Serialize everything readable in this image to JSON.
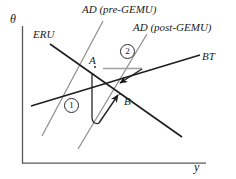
{
  "figure": {
    "axes": {
      "y_axis_label": "θ",
      "x_axis_label": "y",
      "origin": [
        22,
        163
      ],
      "x_axis_end": [
        205,
        163
      ],
      "y_axis_top": [
        22,
        26
      ],
      "axis_color": "#555555"
    },
    "curves": [
      {
        "name": "AD (pre-GEMU)",
        "label": "AD (pre-GEMU)",
        "slope": "upward",
        "color": "#8a8a8a",
        "from": [
          42,
          136
        ],
        "to": [
          103,
          21
        ]
      },
      {
        "name": "AD (post-GEMU)",
        "label": "AD (post-GEMU)",
        "slope": "upward",
        "color": "#8a8a8a",
        "from": [
          78,
          149
        ],
        "to": [
          147,
          34
        ]
      },
      {
        "name": "ERU",
        "label": "ERU",
        "slope": "downward",
        "color": "#222222",
        "from": [
          50,
          44
        ],
        "to": [
          182,
          137
        ]
      },
      {
        "name": "BT",
        "label": "BT",
        "slope": "upward",
        "color": "#222222",
        "from": [
          31,
          106
        ],
        "to": [
          200,
          55
        ]
      }
    ],
    "points": [
      {
        "name": "A",
        "label": "A",
        "at": [
          95,
          67
        ]
      },
      {
        "name": "B",
        "label": "B",
        "at": [
          120,
          95
        ]
      }
    ],
    "annotations": [
      {
        "name": "stage-one",
        "label": "1",
        "style": "circled",
        "at": [
          70,
          104
        ]
      },
      {
        "name": "stage-two",
        "label": "2",
        "style": "circled",
        "at": [
          126,
          50
        ]
      }
    ],
    "adjustment_path": {
      "name": "adjustment-path-A-to-B",
      "description": "Path from A downward, along the bottom, then up-right to B",
      "arrow_count": 2,
      "color": "#222222"
    },
    "reference_segment": {
      "name": "horizontal-reference-segment",
      "from": [
        103,
        68
      ],
      "to": [
        142,
        68
      ],
      "color": "#9a9a9a"
    },
    "background_color": "#ffffff",
    "line_color": "#222222",
    "light_line_color": "#8a8a8a"
  }
}
